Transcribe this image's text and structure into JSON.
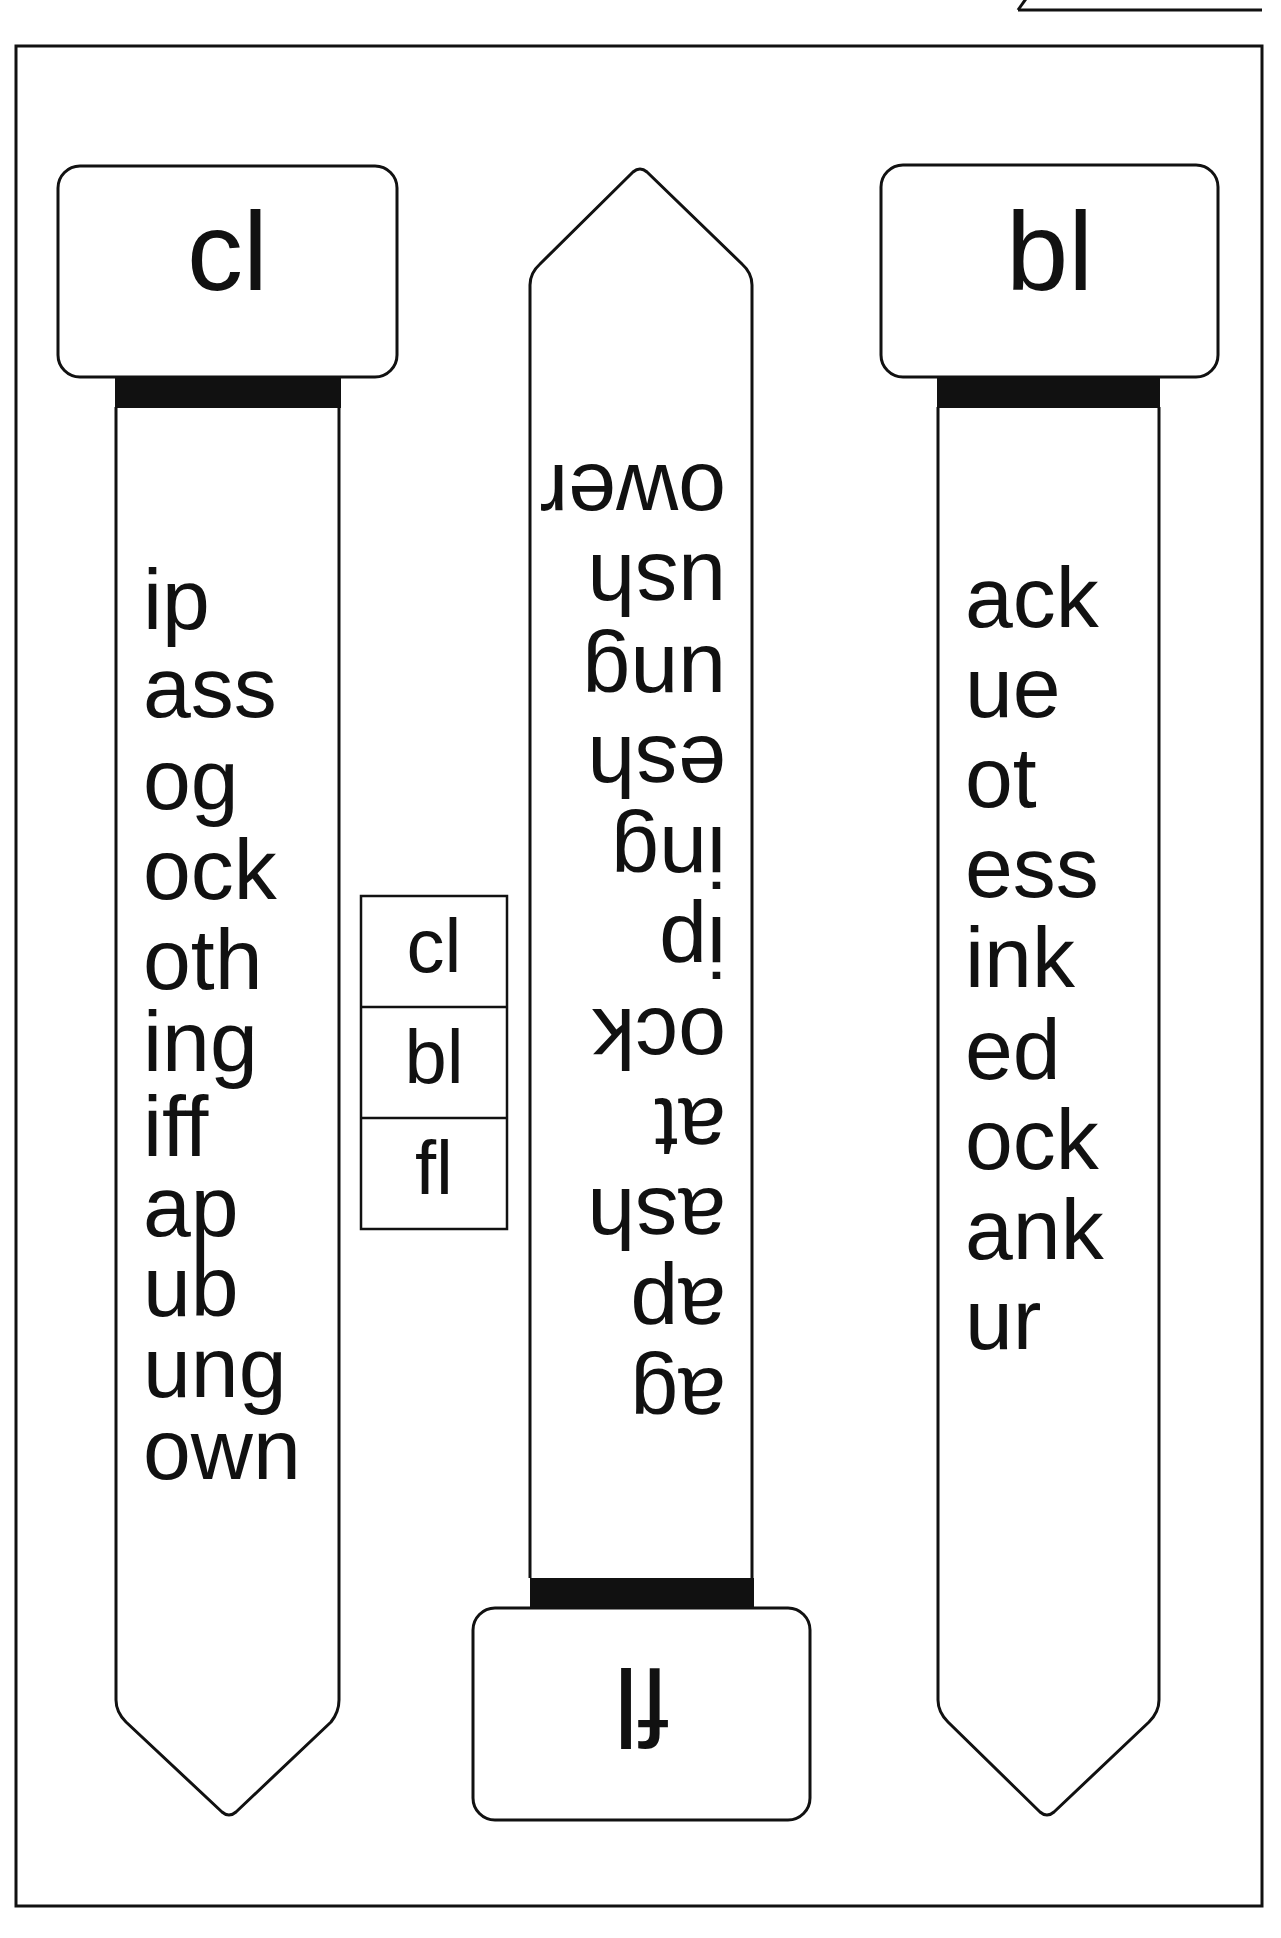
{
  "worksheet": {
    "type": "blend word wheel / strip activity",
    "colors": {
      "ink": "#111111",
      "paper": "#ffffff",
      "band": "#111111"
    }
  },
  "strips": [
    {
      "id": "cl",
      "header": "cl",
      "orientation": "upright",
      "words": [
        "ip",
        "ass",
        "og",
        "ock",
        "oth",
        "ing",
        "iff",
        "ap",
        "ub",
        "ung",
        "own"
      ]
    },
    {
      "id": "fl",
      "header": "fl",
      "orientation": "upside-down",
      "words": [
        "ag",
        "ap",
        "ash",
        "at",
        "ock",
        "ip",
        "ing",
        "esh",
        "ung",
        "ush",
        "ower"
      ]
    },
    {
      "id": "bl",
      "header": "bl",
      "orientation": "upright",
      "words": [
        "ack",
        "ue",
        "ot",
        "ess",
        "ink",
        "ed",
        "ock",
        "ank",
        "ur"
      ]
    }
  ],
  "legend": {
    "cells": [
      "cl",
      "bl",
      "fl"
    ]
  }
}
